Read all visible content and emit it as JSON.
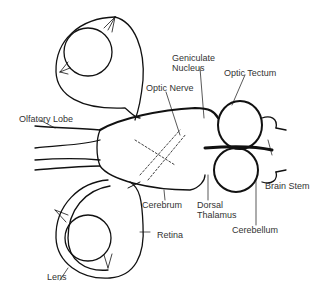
{
  "diagram": {
    "labels": {
      "geniculate_nucleus_1": "Geniculate",
      "geniculate_nucleus_2": "Nucleus",
      "optic_tectum": "Optic Tectum",
      "optic_nerve": "Optic Nerve",
      "olfactory_lobe": "Olfatory Lobe",
      "brain_stem": "Brain Stem",
      "cerebrum": "Cerebrum",
      "dorsal_thalamus_1": "Dorsal",
      "dorsal_thalamus_2": "Thalamus",
      "cerebellum": "Cerebellum",
      "retina": "Retina",
      "lens": "Lens"
    },
    "colors": {
      "ink": "#111111",
      "label": "#333333",
      "background": "#ffffff"
    }
  }
}
